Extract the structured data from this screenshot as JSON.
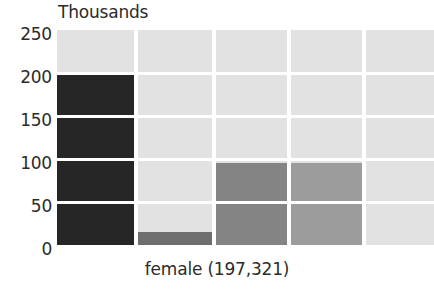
{
  "chart_data": {
    "type": "bar",
    "title": "Thousands",
    "xlabel": "female (197,321)",
    "ylabel": "Thousands",
    "ylim": [
      0,
      250
    ],
    "yticks": [
      250,
      200,
      150,
      100,
      50,
      0
    ],
    "ytick_labels": [
      "250",
      "200",
      "150",
      "100",
      "50",
      "0"
    ],
    "grid": true,
    "legend": "none",
    "categories": [
      "1",
      "2",
      "3",
      "4",
      "5"
    ],
    "values": [
      200,
      15,
      95,
      95,
      0
    ],
    "series": [
      {
        "name": "female count (thousands)",
        "values": [
          200,
          15,
          95,
          95,
          0
        ]
      }
    ],
    "bar_colors": [
      "#262626",
      "#6e6e6e",
      "#848484",
      "#9c9c9c",
      "#e2e2e2"
    ],
    "background_color": "#e2e2e2",
    "gridline_color": "#ffffff",
    "text_color": "#2b2b2b",
    "total_label": "197,321"
  },
  "axis": {
    "y_title": "Thousands",
    "x_caption": "female (197,321)",
    "ticks": [
      {
        "label": "250",
        "value": 250
      },
      {
        "label": "200",
        "value": 200
      },
      {
        "label": "150",
        "value": 150
      },
      {
        "label": "100",
        "value": 100
      },
      {
        "label": "50",
        "value": 50
      },
      {
        "label": "0",
        "value": 0
      }
    ]
  },
  "columns": [
    {
      "name": "column-1",
      "value": 200,
      "color": "#262626"
    },
    {
      "name": "column-2",
      "value": 15,
      "color": "#6e6e6e"
    },
    {
      "name": "column-3",
      "value": 95,
      "color": "#848484"
    },
    {
      "name": "column-4",
      "value": 95,
      "color": "#9c9c9c"
    },
    {
      "name": "column-5",
      "value": 0,
      "color": "#e2e2e2"
    }
  ]
}
